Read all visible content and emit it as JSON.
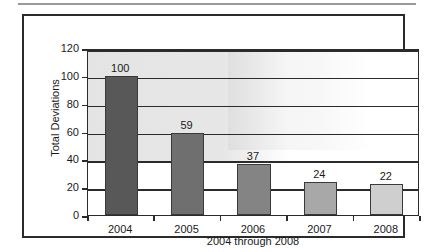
{
  "figure": {
    "frame_border_color": "#2b2b2b",
    "background_color": "#ffffff"
  },
  "chart_data": {
    "type": "bar",
    "title": "",
    "subtitle": "",
    "xlabel": "2004 through 2008",
    "ylabel": "Total Deviations",
    "categories": [
      "2004",
      "2005",
      "2006",
      "2007",
      "2008"
    ],
    "values": [
      100,
      59,
      37,
      24,
      22
    ],
    "data_labels": [
      "100",
      "59",
      "37",
      "24",
      "22"
    ],
    "ylim": [
      0,
      120
    ],
    "yticks": [
      0,
      20,
      40,
      60,
      80,
      100,
      120
    ],
    "ytick_labels": [
      "0",
      "20",
      "40",
      "60",
      "80",
      "100",
      "120"
    ],
    "grid": "horizontal",
    "legend": "none",
    "bar_colors": [
      "#585858",
      "#6f6f6f",
      "#848484",
      "#a8a8a8",
      "#cfcfcf"
    ],
    "bar_edge_color": "#3a3a3a",
    "series": [
      {
        "name": "Total Deviations",
        "values": [
          100,
          59,
          37,
          24,
          22
        ]
      }
    ]
  }
}
